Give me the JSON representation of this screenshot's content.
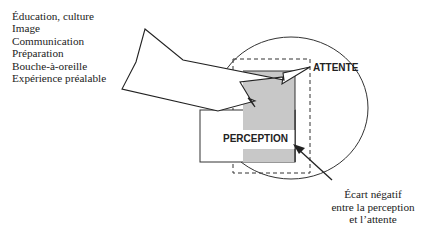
{
  "factors": [
    "Éducation, culture",
    "Image",
    "Communication",
    "Préparation",
    "Bouche-à-oreille",
    "Expérience préalable"
  ],
  "labels": {
    "expectation": "ATTENTE",
    "perception": "PERCEPTION"
  },
  "caption": {
    "line1": "Écart négatif",
    "line2": "entre la perception",
    "line3": "et l’attente"
  },
  "colors": {
    "stroke": "#222222",
    "gray_fill": "#c8c8c8"
  }
}
